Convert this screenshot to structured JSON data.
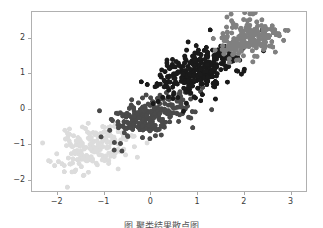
{
  "figure": {
    "background_color": "#ffffff",
    "frame_color": "#b0b0b0",
    "caption": "图  聚类结果散点图"
  },
  "chart_data": {
    "type": "scatter",
    "title": "",
    "xlabel": "",
    "ylabel": "",
    "xlim": [
      -2.55,
      3.35
    ],
    "ylim": [
      -2.35,
      2.75
    ],
    "xticks": [
      -2,
      -1,
      0,
      1,
      2,
      3
    ],
    "xtick_labels": [
      "−2",
      "−1",
      "0",
      "1",
      "2",
      "3"
    ],
    "yticks": [
      -2,
      -1,
      0,
      1,
      2
    ],
    "ytick_labels": [
      "−2",
      "−1",
      "0",
      "1",
      "2"
    ],
    "grid": false,
    "legend": null,
    "marker_size": 5.0,
    "series": [
      {
        "name": "cluster-1",
        "color": "#dcdcdc",
        "n_points": 185,
        "center": [
          -1.2,
          -1.1
        ],
        "spread": [
          0.42,
          0.36
        ],
        "correlation": 0.45,
        "seed": 11
      },
      {
        "name": "cluster-2",
        "color": "#4a4a4a",
        "n_points": 230,
        "center": [
          0.05,
          -0.2
        ],
        "spread": [
          0.44,
          0.33
        ],
        "correlation": 0.55,
        "seed": 27
      },
      {
        "name": "cluster-3",
        "color": "#1a1a1a",
        "n_points": 300,
        "center": [
          1.02,
          1.02
        ],
        "spread": [
          0.42,
          0.38
        ],
        "correlation": 0.45,
        "seed": 43
      },
      {
        "name": "cluster-4",
        "color": "#808080",
        "n_points": 190,
        "center": [
          2.1,
          2.0
        ],
        "spread": [
          0.34,
          0.28
        ],
        "correlation": 0.3,
        "seed": 59
      }
    ]
  }
}
